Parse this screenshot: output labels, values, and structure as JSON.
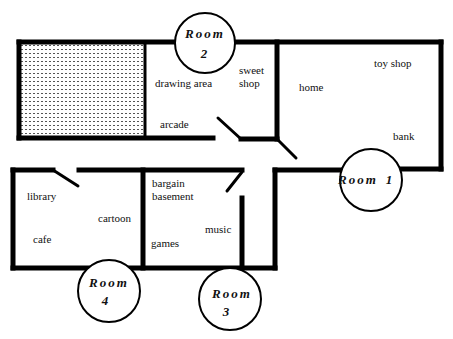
{
  "diagram": {
    "type": "floor-plan",
    "colors": {
      "walls": "#000000",
      "background": "#ffffff",
      "hatched_area": "#555555"
    },
    "rooms": [
      {
        "id": "room1",
        "title": "Room",
        "number": "1",
        "cx": 371,
        "cy": 180
      },
      {
        "id": "room2",
        "title": "Room",
        "number": "2",
        "cx": 205,
        "cy": 43
      },
      {
        "id": "room3",
        "title": "Room",
        "number": "3",
        "cx": 230,
        "cy": 299
      },
      {
        "id": "room4",
        "title": "Room",
        "number": "4",
        "cx": 109,
        "cy": 291
      }
    ],
    "labels": {
      "drawing_area": "drawing area",
      "sweet": "sweet",
      "shop": "shop",
      "arcade": "arcade",
      "home": "home",
      "toy_shop": "toy shop",
      "bank": "bank",
      "library": "library",
      "cartoon": "cartoon",
      "cafe": "cafe",
      "bargain": "bargain",
      "basement": "basement",
      "music": "music",
      "games": "games"
    }
  }
}
